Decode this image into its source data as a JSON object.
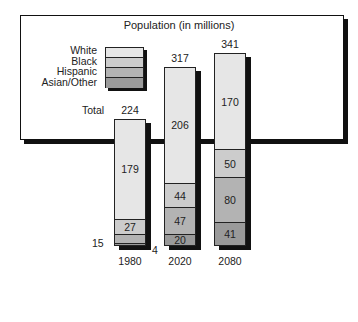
{
  "colors": {
    "white_seg": "#e6e6e6",
    "black_seg": "#cccccc",
    "hispanic_seg": "#b3b3b3",
    "asian_seg": "#9a9a9a",
    "pot": "#8c8c8c",
    "pot_rim": "#a0a0a0",
    "pot_inner": "#f7f7f7",
    "outline": "#111111"
  },
  "chart_data": {
    "type": "bar",
    "stacked": true,
    "title": "Population (in millions)",
    "categories": [
      "1980",
      "2020",
      "2080"
    ],
    "series": [
      {
        "name": "White",
        "values": [
          179,
          206,
          170
        ]
      },
      {
        "name": "Black",
        "values": [
          27,
          44,
          50
        ]
      },
      {
        "name": "Hispanic",
        "values": [
          15,
          47,
          80
        ]
      },
      {
        "name": "Asian/Other",
        "values": [
          4,
          20,
          41
        ]
      }
    ],
    "totals": [
      224,
      317,
      341
    ],
    "total_label": "Total",
    "legend": [
      "White",
      "Black",
      "Hispanic",
      "Asian/Other"
    ],
    "legend_position": "top-left",
    "grid": false,
    "xlabel": "",
    "ylabel": ""
  }
}
